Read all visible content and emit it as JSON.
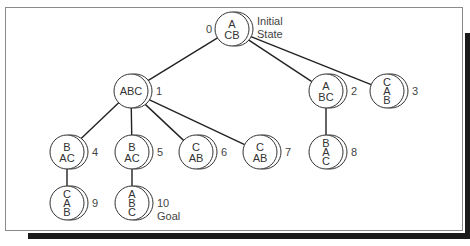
{
  "diagram": {
    "nodes": [
      {
        "id": "0",
        "label": "0",
        "rows": [
          "A",
          "CB"
        ],
        "note": [
          "Initial",
          "State"
        ]
      },
      {
        "id": "1",
        "label": "1",
        "rows": [
          "ABC"
        ],
        "note": []
      },
      {
        "id": "2",
        "label": "2",
        "rows": [
          "A",
          "BC"
        ],
        "note": []
      },
      {
        "id": "3",
        "label": "3",
        "rows": [
          "C",
          "A",
          "B"
        ],
        "note": []
      },
      {
        "id": "4",
        "label": "4",
        "rows": [
          "B",
          "AC"
        ],
        "note": []
      },
      {
        "id": "5",
        "label": "5",
        "rows": [
          "B",
          "AC"
        ],
        "note": []
      },
      {
        "id": "6",
        "label": "6",
        "rows": [
          "C",
          "AB"
        ],
        "note": []
      },
      {
        "id": "7",
        "label": "7",
        "rows": [
          "C",
          "AB"
        ],
        "note": []
      },
      {
        "id": "8",
        "label": "8",
        "rows": [
          "B",
          "A",
          "C"
        ],
        "note": []
      },
      {
        "id": "9",
        "label": "9",
        "rows": [
          "C",
          "A",
          "B"
        ],
        "note": []
      },
      {
        "id": "10",
        "label": "10",
        "rows": [
          "A",
          "B",
          "C"
        ],
        "note": [
          "Goal"
        ]
      }
    ],
    "edges": [
      [
        "0",
        "1"
      ],
      [
        "0",
        "2"
      ],
      [
        "0",
        "3"
      ],
      [
        "1",
        "4"
      ],
      [
        "1",
        "5"
      ],
      [
        "1",
        "6"
      ],
      [
        "1",
        "7"
      ],
      [
        "2",
        "8"
      ],
      [
        "4",
        "9"
      ],
      [
        "5",
        "10"
      ]
    ]
  }
}
